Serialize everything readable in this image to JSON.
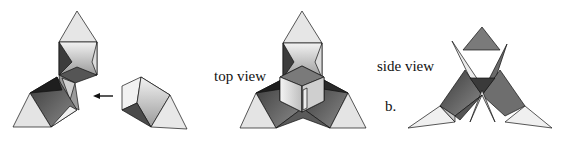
{
  "figure": {
    "panel_label": "b.",
    "views": [
      {
        "id": "assembly",
        "label": ""
      },
      {
        "id": "top",
        "label": "top view"
      },
      {
        "id": "side",
        "label": "side view"
      }
    ],
    "arrow": {
      "direction": "left"
    }
  },
  "colors": {
    "light": "#e8e8e8",
    "mid_light": "#c8c8c8",
    "mid": "#909090",
    "dark": "#555555",
    "darker": "#333333",
    "stroke": "#111111"
  }
}
